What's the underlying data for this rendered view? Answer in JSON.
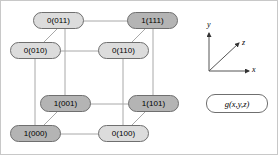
{
  "figure": {
    "background": "#ffffff",
    "border_color": "#c8c8c8"
  },
  "colors": {
    "node_value_0_fill": "#dcdcdc",
    "node_value_1_fill": "#b4b4b4",
    "node_stroke": "#6f6f6f",
    "edge_stroke": "#a8a8a8",
    "axis_stroke": "#555555",
    "text": "#000000",
    "func_box_fill": "#ffffff"
  },
  "chart_data": {
    "type": "diagram",
    "function_label": "g(x,y,z)",
    "nodes": [
      {
        "id": "011",
        "label": "0(011)",
        "value": 0,
        "minterm": "011",
        "x": 64,
        "y": 20
      },
      {
        "id": "111",
        "label": "1(111)",
        "value": 1,
        "minterm": "111",
        "x": 152,
        "y": 20
      },
      {
        "id": "010",
        "label": "0(010)",
        "value": 0,
        "minterm": "010",
        "x": 34,
        "y": 50
      },
      {
        "id": "110",
        "label": "0(110)",
        "value": 0,
        "minterm": "110",
        "x": 122,
        "y": 50
      },
      {
        "id": "001",
        "label": "1(001)",
        "value": 1,
        "minterm": "001",
        "x": 64,
        "y": 103
      },
      {
        "id": "101",
        "label": "1(101)",
        "value": 1,
        "minterm": "101",
        "x": 152,
        "y": 103
      },
      {
        "id": "000",
        "label": "1(000)",
        "value": 1,
        "minterm": "000",
        "x": 34,
        "y": 133
      },
      {
        "id": "100",
        "label": "0(100)",
        "value": 0,
        "minterm": "100",
        "x": 122,
        "y": 133
      }
    ],
    "edges": [
      {
        "from": "011",
        "to": "111"
      },
      {
        "from": "011",
        "to": "010"
      },
      {
        "from": "011",
        "to": "001"
      },
      {
        "from": "111",
        "to": "110"
      },
      {
        "from": "111",
        "to": "101"
      },
      {
        "from": "010",
        "to": "110"
      },
      {
        "from": "010",
        "to": "000"
      },
      {
        "from": "110",
        "to": "100"
      },
      {
        "from": "001",
        "to": "101"
      },
      {
        "from": "001",
        "to": "000"
      },
      {
        "from": "101",
        "to": "100"
      },
      {
        "from": "000",
        "to": "100"
      }
    ],
    "legend": {
      "axes": [
        {
          "name": "x",
          "label": "x",
          "direction": "right"
        },
        {
          "name": "y",
          "label": "y",
          "direction": "up"
        },
        {
          "name": "z",
          "label": "z",
          "direction": "up-right-diagonal"
        }
      ]
    }
  }
}
